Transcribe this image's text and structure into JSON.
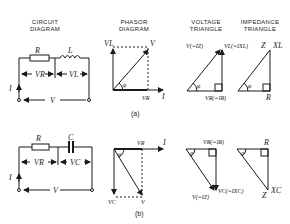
{
  "headers": {
    "circuit": "CIRCUIT DIAGRAM",
    "phasor": "PHASOR DIAGRAM",
    "voltage": "VOLTAGE TRIANGLE",
    "impedance": "IMPEDANCE TRIANGLE"
  },
  "part_a": {
    "caption": "(a)",
    "circuit": {
      "R": "R",
      "L": "L",
      "VR": "VR",
      "VL": "VL",
      "I": "I",
      "V": "V"
    },
    "phasor": {
      "VL": "VL",
      "V": "V",
      "VR": "VR",
      "I": "I",
      "angle": "φ"
    },
    "voltage_triangle": {
      "V": "V(=IZ)",
      "VL": "VL(=IXL)",
      "VR": "VR(=IR)",
      "angle": "φ"
    },
    "impedance_triangle": {
      "Z": "Z",
      "XL": "XL",
      "R": "R",
      "angle": "φ"
    }
  },
  "part_b": {
    "caption": "(b)",
    "circuit": {
      "R": "R",
      "C": "C",
      "VR": "VR",
      "VC": "VC",
      "I": "I",
      "V": "V"
    },
    "phasor": {
      "VR": "VR",
      "I": "I",
      "VC": "VC",
      "V": "V",
      "angle": "α"
    },
    "voltage_triangle": {
      "VR": "VR(=IR)",
      "VC": "VC(=IXC)",
      "V": "V(=IZ)",
      "angle": "α"
    },
    "impedance_triangle": {
      "R": "R",
      "XC": "XC",
      "Z": "Z",
      "angle": "α"
    }
  }
}
